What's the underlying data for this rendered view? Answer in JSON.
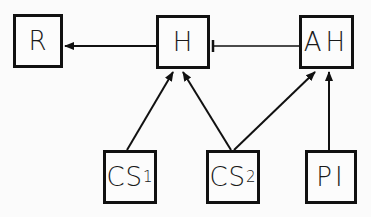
{
  "diagram": {
    "nodes": [
      {
        "id": "R",
        "label": "R",
        "sub": "",
        "x": 13,
        "y": 14,
        "w": 50,
        "h": 54
      },
      {
        "id": "H",
        "label": "H",
        "sub": "",
        "x": 156,
        "y": 15,
        "w": 54,
        "h": 54
      },
      {
        "id": "AH",
        "label": "AH",
        "sub": "",
        "x": 299,
        "y": 15,
        "w": 55,
        "h": 54
      },
      {
        "id": "CS1",
        "label": "CS",
        "sub": "1",
        "x": 103,
        "y": 150,
        "w": 54,
        "h": 54
      },
      {
        "id": "CS2",
        "label": "CS",
        "sub": "2",
        "x": 206,
        "y": 150,
        "w": 54,
        "h": 54
      },
      {
        "id": "PI",
        "label": "PI",
        "sub": "",
        "x": 305,
        "y": 150,
        "w": 52,
        "h": 54
      }
    ],
    "edges": [
      {
        "from": "H",
        "to": "R",
        "type": "arrow"
      },
      {
        "from": "AH",
        "to": "H",
        "type": "inhibit"
      },
      {
        "from": "CS1",
        "to": "H",
        "type": "arrow"
      },
      {
        "from": "CS2",
        "to": "H",
        "type": "arrow"
      },
      {
        "from": "CS2",
        "to": "AH",
        "type": "arrow"
      },
      {
        "from": "PI",
        "to": "AH",
        "type": "arrow"
      }
    ],
    "colors": {
      "line": "#111111",
      "background": "#fbfbfb"
    }
  }
}
